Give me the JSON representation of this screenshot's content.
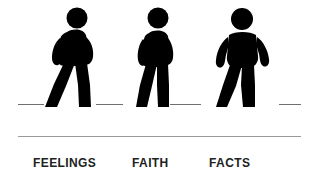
{
  "canvas": {
    "width": 312,
    "height": 190,
    "background_color": "#ffffff",
    "figure_color": "#000000",
    "text_color": "#222222",
    "rule_color": "#9a9a9a",
    "ground_color": "#6f6f6f"
  },
  "items": [
    {
      "id": "feelings",
      "label": "FEELINGS",
      "icon_name": "walking-person-icon",
      "pose": "leaning-forward-wide-stride"
    },
    {
      "id": "faith",
      "label": "FAITH",
      "icon_name": "walking-person-icon",
      "pose": "upright-medium-stride"
    },
    {
      "id": "facts",
      "label": "FACTS",
      "icon_name": "walking-person-icon",
      "pose": "front-facing-stride"
    }
  ],
  "ground": {
    "name": "dashed-ground-line",
    "dashes": [
      {
        "left": 18,
        "width": 26
      },
      {
        "left": 96,
        "width": 27
      },
      {
        "left": 170,
        "width": 31
      },
      {
        "left": 279,
        "width": 22
      }
    ]
  },
  "divider": {
    "name": "horizontal-rule"
  }
}
